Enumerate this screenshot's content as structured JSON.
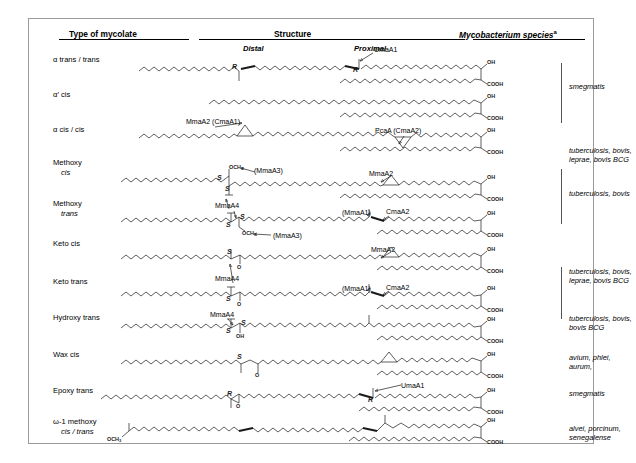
{
  "header": {
    "type_col": "Type of mycolate",
    "structure_col": "Structure",
    "species_col": "Mycobacterium species",
    "species_superscript": "a"
  },
  "structure_sublabels": {
    "distal": "Distal",
    "proximal": "Proximal"
  },
  "rows": [
    {
      "id": "alpha-trans-trans",
      "label_line1": "α  trans / trans",
      "label_line2": "",
      "species": "smegmatis"
    },
    {
      "id": "alpha-prime-cis",
      "label_line1": "α′ cis",
      "label_line2": "",
      "species": ""
    },
    {
      "id": "alpha-cis-cis",
      "label_line1": "α  cis / cis",
      "label_line2": "",
      "species": "tuberculosis, bovis,\nleprae, bovis BCG"
    },
    {
      "id": "methoxy-cis",
      "label_line1": "Methoxy",
      "label_line2": "cis",
      "species": "tuberculosis, bovis"
    },
    {
      "id": "methoxy-trans",
      "label_line1": "Methoxy",
      "label_line2": "trans",
      "species": ""
    },
    {
      "id": "keto-cis",
      "label_line1": "Keto cis",
      "label_line2": "",
      "species": "tuberculosis, bovis,\nleprae, bovis BCG"
    },
    {
      "id": "keto-trans",
      "label_line1": "Keto trans",
      "label_line2": "",
      "species": ""
    },
    {
      "id": "hydroxy-trans",
      "label_line1": "Hydroxy trans",
      "label_line2": "",
      "species": "tuberculosis, bovis,\nbovis BCG"
    },
    {
      "id": "wax-cis",
      "label_line1": "Wax cis",
      "label_line2": "",
      "species": "avium, phlei,\naurum,"
    },
    {
      "id": "epoxy-trans",
      "label_line1": "Epoxy trans",
      "label_line2": "",
      "species": "smegmatis"
    },
    {
      "id": "omega-1-methoxy",
      "label_line1": "ω-1 methoxy",
      "label_line2": "cis / trans",
      "species": "alvei, porcinum,\nsenegalense"
    }
  ],
  "enzymes": [
    {
      "id": "e-umaa1-row1",
      "text": "UmaA1"
    },
    {
      "id": "e-mmaa2-cmaa1",
      "text": "MmaA2 (CmaA1)"
    },
    {
      "id": "e-pcaa-cmaa2",
      "text": "PcaA (CmaA2)"
    },
    {
      "id": "e-mmaa3-mcis",
      "text": "(MmaA3)"
    },
    {
      "id": "e-mmaa2-mcis",
      "text": "MmaA2"
    },
    {
      "id": "e-mmaa4-mcis",
      "text": "MmaA4"
    },
    {
      "id": "e-mmaa1-mtrans",
      "text": "(MmaA1)"
    },
    {
      "id": "e-cmaa2-mtrans",
      "text": "CmaA2"
    },
    {
      "id": "e-mmaa3-mtrans",
      "text": "(MmaA3)"
    },
    {
      "id": "e-mmaa2-kcis",
      "text": "MmaA2"
    },
    {
      "id": "e-mmaa4-kcis",
      "text": "MmaA4"
    },
    {
      "id": "e-mmaa1-ktrans",
      "text": "(MmaA1)"
    },
    {
      "id": "e-cmaa2-ktrans",
      "text": "CmaA2"
    },
    {
      "id": "e-mmaa4-hydroxy",
      "text": "MmaA4"
    },
    {
      "id": "e-umaa1-epoxy",
      "text": "UmaA1"
    }
  ],
  "chem_groups": {
    "oh": "OH",
    "cooh": "COOH",
    "och3": "OCH",
    "och3_sub": "3",
    "stereo_r": "R",
    "stereo_s": "S",
    "o": "O"
  },
  "colors": {
    "border": "#9a9a9a",
    "ink": "#1a1a1a",
    "bracket": "#555555"
  }
}
